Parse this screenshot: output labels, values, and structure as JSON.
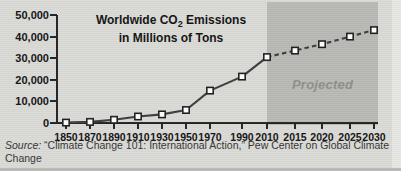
{
  "chart_data": {
    "type": "line",
    "title": "Worldwide CO2 Emissions in Millions of Tons",
    "title_line1": "Worldwide CO",
    "title_sub": "2",
    "title_line1_rest": " Emissions",
    "title_line2": "in Millions of Tons",
    "xlabel": "",
    "ylabel": "",
    "categories": [
      "1850",
      "1870",
      "1890",
      "1910",
      "1930",
      "1950",
      "1970",
      "1990",
      "2010",
      "2015",
      "2020",
      "2025",
      "2030"
    ],
    "values": [
      200,
      500,
      1500,
      3000,
      4000,
      6000,
      15000,
      21500,
      30500,
      33500,
      36500,
      40000,
      43000
    ],
    "ylim": [
      0,
      50000
    ],
    "ytick_values": [
      0,
      10000,
      20000,
      30000,
      40000,
      50000
    ],
    "ytick_labels": [
      "0",
      "10,000",
      "20,000",
      "30,000",
      "40,000",
      "50,000"
    ],
    "grid": false,
    "legend": "none",
    "annotations": [
      {
        "name": "projected-region",
        "label": "Projected",
        "start_category": "2010",
        "end_category": "2030"
      }
    ],
    "series_style": {
      "historical_line": "solid",
      "projected_line": "dashed",
      "marker": "square",
      "line_color": "#3b3b3b",
      "marker_fill": "#ffffff",
      "marker_edge": "#1f1f1f"
    }
  },
  "colors": {
    "background": "#d9d9d6",
    "projected_band": "#b8b8b4",
    "projected_text": "#8e8e8a",
    "axis": "#222222",
    "text": "#111111"
  },
  "source": {
    "label": "Source:",
    "text": " “Climate Change 101: International Action,” Pew Center on Global Climate Change"
  }
}
